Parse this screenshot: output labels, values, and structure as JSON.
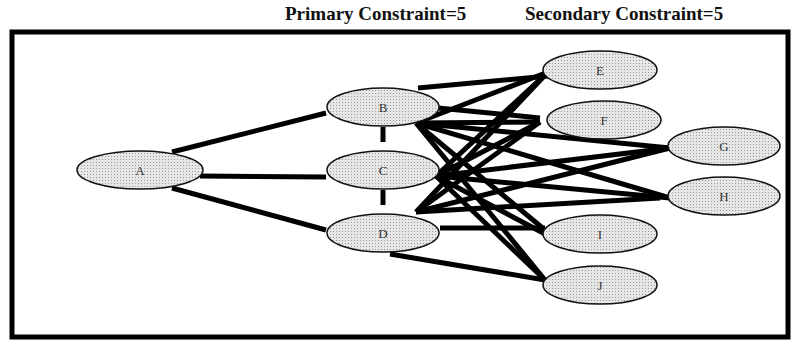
{
  "header": {
    "primary": "Primary Constraint=5",
    "secondary": "Secondary Constraint=5"
  },
  "colors": {
    "node_fill": "#d9d9d9",
    "edge": "#000000",
    "frame": "#000000"
  },
  "nodes": [
    {
      "id": "A",
      "label": "A",
      "cx": 140,
      "cy": 170,
      "rx": 63,
      "ry": 19
    },
    {
      "id": "B",
      "label": "B",
      "cx": 383,
      "cy": 107,
      "rx": 56,
      "ry": 19
    },
    {
      "id": "C",
      "label": "C",
      "cx": 383,
      "cy": 170,
      "rx": 56,
      "ry": 19
    },
    {
      "id": "D",
      "label": "D",
      "cx": 383,
      "cy": 233,
      "rx": 56,
      "ry": 19
    },
    {
      "id": "E",
      "label": "E",
      "cx": 600,
      "cy": 70,
      "rx": 57,
      "ry": 19
    },
    {
      "id": "F",
      "label": "F",
      "cx": 604,
      "cy": 120,
      "rx": 57,
      "ry": 19
    },
    {
      "id": "G",
      "label": "G",
      "cx": 724,
      "cy": 146,
      "rx": 56,
      "ry": 19
    },
    {
      "id": "H",
      "label": "H",
      "cx": 724,
      "cy": 196,
      "rx": 56,
      "ry": 19
    },
    {
      "id": "I",
      "label": "I",
      "cx": 600,
      "cy": 234,
      "rx": 57,
      "ry": 19
    },
    {
      "id": "J",
      "label": "J",
      "cx": 600,
      "cy": 285,
      "rx": 57,
      "ry": 19
    }
  ],
  "edges": [
    [
      172,
      152,
      326,
      113
    ],
    [
      200,
      176,
      326,
      177
    ],
    [
      172,
      188,
      326,
      230
    ],
    [
      383,
      127,
      383,
      142
    ],
    [
      383,
      190,
      383,
      205
    ],
    [
      418,
      88,
      548,
      76
    ],
    [
      438,
      108,
      540,
      118
    ],
    [
      416,
      123,
      548,
      72
    ],
    [
      416,
      123,
      540,
      122
    ],
    [
      416,
      123,
      670,
      148
    ],
    [
      416,
      123,
      670,
      198
    ],
    [
      416,
      123,
      545,
      230
    ],
    [
      416,
      123,
      545,
      280
    ],
    [
      436,
      176,
      548,
      72
    ],
    [
      436,
      176,
      540,
      122
    ],
    [
      436,
      176,
      670,
      148
    ],
    [
      436,
      176,
      670,
      198
    ],
    [
      436,
      176,
      545,
      234
    ],
    [
      436,
      176,
      545,
      280
    ],
    [
      416,
      212,
      548,
      72
    ],
    [
      416,
      212,
      540,
      122
    ],
    [
      416,
      212,
      670,
      148
    ],
    [
      416,
      212,
      660,
      198
    ],
    [
      440,
      228,
      545,
      228
    ],
    [
      390,
      254,
      545,
      280
    ]
  ]
}
